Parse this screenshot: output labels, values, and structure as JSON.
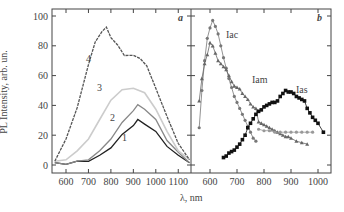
{
  "chart_data": [
    {
      "panel": "a",
      "type": "line",
      "title": "",
      "panel_label": "a",
      "xlabel": "λ, nm",
      "ylabel": "PL Intensity, arb. un.",
      "xticks": [
        600,
        700,
        800,
        900,
        1000,
        1100
      ],
      "yticks": [
        0,
        20,
        40,
        60,
        80,
        100
      ],
      "xlim": [
        540,
        1160
      ],
      "ylim": [
        -5,
        105
      ],
      "grid": false,
      "series": [
        {
          "name": "1",
          "color": "#222222",
          "x": [
            550,
            600,
            650,
            700,
            750,
            800,
            850,
            900,
            920,
            950,
            1000,
            1050,
            1100,
            1150
          ],
          "values": [
            1,
            1,
            2,
            3,
            6,
            12,
            20,
            27,
            30,
            28,
            22,
            13,
            6,
            2
          ]
        },
        {
          "name": "2",
          "color": "#888888",
          "x": [
            550,
            600,
            650,
            700,
            750,
            800,
            850,
            900,
            920,
            950,
            1000,
            1050,
            1100,
            1150
          ],
          "values": [
            1,
            1,
            2,
            4,
            9,
            18,
            28,
            37,
            40,
            38,
            30,
            17,
            8,
            2
          ]
        },
        {
          "name": "3",
          "color": "#cccccc",
          "x": [
            550,
            600,
            650,
            700,
            750,
            800,
            850,
            900,
            950,
            1000,
            1050,
            1100,
            1150
          ],
          "values": [
            2,
            4,
            9,
            18,
            30,
            44,
            50,
            52,
            48,
            38,
            22,
            10,
            3
          ]
        },
        {
          "name": "4",
          "color": "#555555",
          "x": [
            550,
            600,
            650,
            700,
            730,
            760,
            780,
            800,
            830,
            860,
            900,
            930,
            960,
            1000,
            1050,
            1100,
            1150
          ],
          "values": [
            2,
            18,
            38,
            68,
            82,
            90,
            92,
            86,
            80,
            74,
            73,
            72,
            66,
            52,
            32,
            15,
            3
          ]
        }
      ],
      "annotations": [
        {
          "text": "4",
          "x": 690,
          "y": 68
        },
        {
          "text": "3",
          "x": 780,
          "y": 50
        },
        {
          "text": "2",
          "x": 805,
          "y": 31
        },
        {
          "text": "1",
          "x": 890,
          "y": 19
        }
      ]
    },
    {
      "panel": "b",
      "type": "line",
      "panel_label": "b",
      "xlabel": "λ, nm",
      "xticks": [
        600,
        700,
        800,
        900,
        1000
      ],
      "ylim": [
        -5,
        105
      ],
      "xlim": [
        530,
        1050
      ],
      "grid": false,
      "series": [
        {
          "name": "Iac",
          "color": "#777777",
          "marker": "circle",
          "x": [
            560,
            570,
            580,
            590,
            600,
            610,
            620,
            630,
            640,
            650,
            660,
            670,
            680,
            690,
            700,
            710,
            720,
            730,
            740,
            750,
            760,
            770
          ],
          "values": [
            25,
            50,
            70,
            85,
            92,
            97,
            93,
            88,
            80,
            72,
            65,
            58,
            52,
            46,
            42,
            38,
            34,
            30,
            26,
            22,
            18,
            16
          ]
        },
        {
          "name": "Iam",
          "color": "#666666",
          "marker": "triangle",
          "x": [
            560,
            570,
            580,
            590,
            600,
            610,
            620,
            630,
            640,
            650,
            660,
            670,
            680,
            690,
            700,
            710,
            720,
            730,
            740,
            750,
            760,
            770,
            780,
            790,
            800,
            810,
            820,
            830,
            840,
            850,
            860,
            870,
            880,
            890,
            900,
            920,
            940,
            960
          ],
          "values": [
            43,
            58,
            68,
            74,
            82,
            80,
            75,
            70,
            68,
            66,
            64,
            60,
            56,
            53,
            52,
            51,
            48,
            46,
            44,
            41,
            39,
            38,
            29,
            28,
            27,
            26,
            25,
            24,
            23,
            22,
            21,
            20,
            19,
            19,
            18,
            16,
            15,
            14
          ],
          "note": "markers continue to ~960 nm near 14-16"
        },
        {
          "name": "Ias",
          "color": "#111111",
          "marker": "square",
          "x": [
            650,
            660,
            670,
            680,
            690,
            700,
            710,
            720,
            730,
            740,
            750,
            760,
            770,
            780,
            790,
            800,
            810,
            820,
            830,
            840,
            850,
            860,
            870,
            880,
            890,
            900,
            910,
            920,
            930,
            940,
            950,
            960,
            970,
            980,
            990,
            1000,
            1020
          ],
          "values": [
            5,
            6,
            8,
            9,
            10,
            12,
            14,
            17,
            20,
            25,
            28,
            31,
            34,
            36,
            37,
            39,
            40,
            41,
            42,
            42,
            43,
            46,
            48,
            50,
            49,
            49,
            48,
            46,
            45,
            44,
            43,
            38,
            35,
            32,
            30,
            28,
            22
          ]
        },
        {
          "name": "Iac-tail",
          "color": "#999999",
          "marker": "circle",
          "x": [
            780,
            800,
            820,
            840,
            860,
            880,
            900,
            920,
            940,
            960,
            980
          ],
          "values": [
            24,
            23,
            23,
            22,
            22,
            22,
            22,
            22,
            22,
            22,
            22
          ]
        }
      ],
      "annotations": [
        {
          "text": "Iac",
          "x": 680,
          "y": 87
        },
        {
          "text": "Iam",
          "x": 780,
          "y": 63
        },
        {
          "text": "Ias",
          "x": 945,
          "y": 51
        }
      ]
    }
  ],
  "labels": {
    "ylabel": "PL Intensity, arb. un.",
    "xlabel": "λ, nm",
    "panel_a": "a",
    "panel_b": "b",
    "left_xticks": [
      "600",
      "700",
      "800",
      "900",
      "1000",
      "1100"
    ],
    "right_xticks": [
      "600",
      "700",
      "800",
      "900",
      "1000"
    ],
    "yticks": [
      "0",
      "20",
      "40",
      "60",
      "80",
      "100"
    ],
    "curve_labels": {
      "c1": "1",
      "c2": "2",
      "c3": "3",
      "c4": "4",
      "iac": "Iac",
      "iam": "Iam",
      "ias": "Ias"
    }
  }
}
